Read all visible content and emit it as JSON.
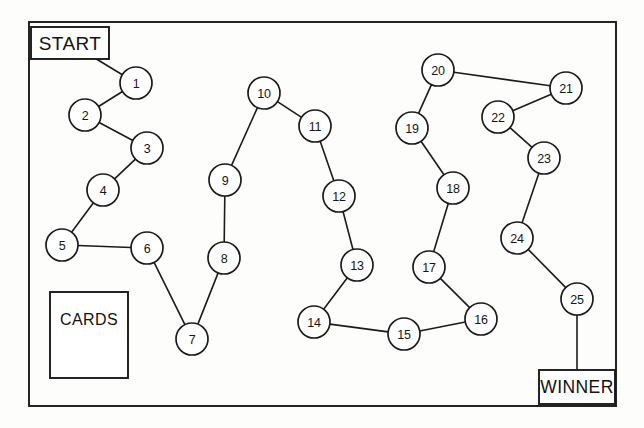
{
  "board": {
    "title": "Board Game Path",
    "background_color": "#fdfdfc",
    "ink_color": "#1b1b1b",
    "border": {
      "x": 29,
      "y": 22,
      "width": 587,
      "height": 384
    }
  },
  "panels": [
    {
      "name": "start",
      "label": "START",
      "x": 31,
      "y": 27,
      "width": 78,
      "height": 32
    },
    {
      "name": "winner",
      "label": "WINNER",
      "x": 539,
      "y": 370,
      "width": 76,
      "height": 34
    },
    {
      "name": "cards",
      "label": "CARDS",
      "x": 50,
      "y": 292,
      "width": 78,
      "height": 86,
      "label_offset_y": 27
    }
  ],
  "spaces": [
    {
      "number": "1",
      "x": 136,
      "y": 83,
      "r": 16
    },
    {
      "number": "2",
      "x": 85,
      "y": 115,
      "r": 16
    },
    {
      "number": "3",
      "x": 147,
      "y": 148,
      "r": 16
    },
    {
      "number": "4",
      "x": 103,
      "y": 190,
      "r": 16
    },
    {
      "number": "5",
      "x": 62,
      "y": 245,
      "r": 16
    },
    {
      "number": "6",
      "x": 147,
      "y": 248,
      "r": 16
    },
    {
      "number": "7",
      "x": 192,
      "y": 339,
      "r": 16
    },
    {
      "number": "8",
      "x": 224,
      "y": 258,
      "r": 16
    },
    {
      "number": "9",
      "x": 225,
      "y": 180,
      "r": 16
    },
    {
      "number": "10",
      "x": 264,
      "y": 93,
      "r": 16
    },
    {
      "number": "11",
      "x": 315,
      "y": 126,
      "r": 16
    },
    {
      "number": "12",
      "x": 339,
      "y": 196,
      "r": 16
    },
    {
      "number": "13",
      "x": 357,
      "y": 265,
      "r": 16
    },
    {
      "number": "14",
      "x": 314,
      "y": 322,
      "r": 16
    },
    {
      "number": "15",
      "x": 404,
      "y": 334,
      "r": 16
    },
    {
      "number": "16",
      "x": 481,
      "y": 319,
      "r": 16
    },
    {
      "number": "17",
      "x": 429,
      "y": 267,
      "r": 16
    },
    {
      "number": "18",
      "x": 453,
      "y": 188,
      "r": 16
    },
    {
      "number": "19",
      "x": 412,
      "y": 128,
      "r": 16
    },
    {
      "number": "20",
      "x": 438,
      "y": 70,
      "r": 16
    },
    {
      "number": "21",
      "x": 566,
      "y": 88,
      "r": 16
    },
    {
      "number": "22",
      "x": 498,
      "y": 117,
      "r": 16
    },
    {
      "number": "23",
      "x": 544,
      "y": 158,
      "r": 16
    },
    {
      "number": "24",
      "x": 517,
      "y": 238,
      "r": 16
    },
    {
      "number": "25",
      "x": 577,
      "y": 299,
      "r": 16
    }
  ],
  "connections": [
    {
      "from": "start",
      "to": "1"
    },
    {
      "from": "1",
      "to": "2"
    },
    {
      "from": "2",
      "to": "3"
    },
    {
      "from": "3",
      "to": "4"
    },
    {
      "from": "4",
      "to": "5"
    },
    {
      "from": "5",
      "to": "6"
    },
    {
      "from": "6",
      "to": "7"
    },
    {
      "from": "7",
      "to": "8"
    },
    {
      "from": "8",
      "to": "9"
    },
    {
      "from": "9",
      "to": "10"
    },
    {
      "from": "10",
      "to": "11"
    },
    {
      "from": "11",
      "to": "12"
    },
    {
      "from": "12",
      "to": "13"
    },
    {
      "from": "13",
      "to": "14"
    },
    {
      "from": "14",
      "to": "15"
    },
    {
      "from": "15",
      "to": "16"
    },
    {
      "from": "16",
      "to": "17"
    },
    {
      "from": "17",
      "to": "18"
    },
    {
      "from": "18",
      "to": "19"
    },
    {
      "from": "19",
      "to": "20"
    },
    {
      "from": "20",
      "to": "21"
    },
    {
      "from": "21",
      "to": "22"
    },
    {
      "from": "22",
      "to": "23"
    },
    {
      "from": "23",
      "to": "24"
    },
    {
      "from": "24",
      "to": "25"
    },
    {
      "from": "25",
      "to": "winner"
    }
  ]
}
